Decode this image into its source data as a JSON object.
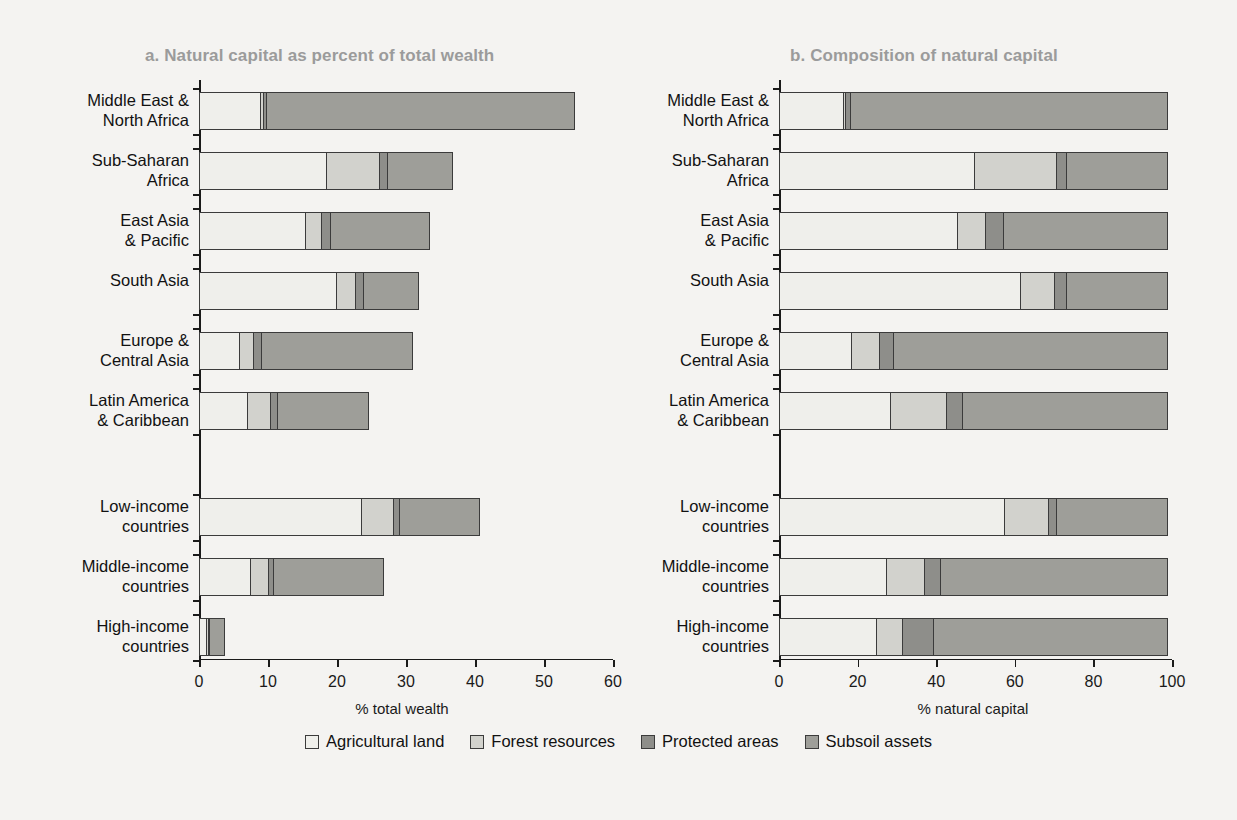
{
  "figure": {
    "panel_a_title": "a. Natural capital as percent of total wealth",
    "panel_b_title": "b. Composition of natural capital"
  },
  "legend": {
    "items": [
      {
        "label": "Agricultural land",
        "color": "#efefeb"
      },
      {
        "label": "Forest resources",
        "color": "#d2d2cd"
      },
      {
        "label": "Protected areas",
        "color": "#8e8e8a"
      },
      {
        "label": "Subsoil assets",
        "color": "#9e9e99"
      }
    ]
  },
  "categories": [
    "Middle East &\nNorth Africa",
    "Sub-Saharan\nAfrica",
    "East Asia\n& Pacific",
    "South Asia",
    "Europe &\nCentral Asia",
    "Latin America\n& Caribbean",
    "Low-income\ncountries",
    "Middle-income\ncountries",
    "High-income\ncountries"
  ],
  "chart_data": [
    {
      "type": "bar",
      "orientation": "horizontal",
      "stacked": true,
      "title": "a. Natural capital as percent of total wealth",
      "xlabel": "% total wealth",
      "ylabel": "",
      "xlim": [
        0,
        60
      ],
      "xticks": [
        0,
        10,
        20,
        30,
        40,
        50,
        60
      ],
      "grid": false,
      "legend_position": "bottom",
      "categories": [
        "Middle East & North Africa",
        "Sub-Saharan Africa",
        "East Asia & Pacific",
        "South Asia",
        "Europe & Central Asia",
        "Latin America & Caribbean",
        "Low-income countries",
        "Middle-income countries",
        "High-income countries"
      ],
      "series": [
        {
          "name": "Agricultural land",
          "values": [
            9.0,
            18.6,
            15.5,
            20.0,
            5.9,
            7.2,
            23.7,
            7.5,
            1.2
          ]
        },
        {
          "name": "Forest resources",
          "values": [
            0.6,
            7.9,
            2.5,
            3.0,
            2.3,
            3.4,
            4.7,
            2.8,
            0.4
          ]
        },
        {
          "name": "Protected areas",
          "values": [
            0.7,
            1.3,
            1.5,
            1.3,
            1.3,
            1.2,
            1.1,
            0.9,
            0.4
          ]
        },
        {
          "name": "Subsoil assets",
          "values": [
            44.7,
            9.5,
            14.5,
            8.1,
            22.0,
            13.4,
            11.7,
            16.1,
            2.3
          ]
        }
      ],
      "totals": [
        55.0,
        37.3,
        34.0,
        32.4,
        31.5,
        25.2,
        41.2,
        27.3,
        4.3
      ]
    },
    {
      "type": "bar",
      "orientation": "horizontal",
      "stacked": true,
      "title": "b. Composition of natural capital",
      "xlabel": "% natural capital",
      "ylabel": "",
      "xlim": [
        0,
        100
      ],
      "xticks": [
        0,
        20,
        40,
        60,
        80,
        100
      ],
      "grid": false,
      "legend_position": "bottom",
      "categories": [
        "Middle East & North Africa",
        "Sub-Saharan Africa",
        "East Asia & Pacific",
        "South Asia",
        "Europe & Central Asia",
        "Latin America & Caribbean",
        "Low-income countries",
        "Middle-income countries",
        "High-income countries"
      ],
      "series": [
        {
          "name": "Agricultural land",
          "values": [
            16.5,
            50.0,
            45.5,
            61.5,
            18.5,
            28.5,
            57.5,
            27.5,
            25.0
          ]
        },
        {
          "name": "Forest resources",
          "values": [
            1.0,
            21.0,
            7.5,
            9.0,
            7.5,
            14.5,
            11.5,
            10.0,
            7.0
          ]
        },
        {
          "name": "Protected areas",
          "values": [
            1.5,
            3.0,
            5.0,
            3.5,
            4.0,
            4.5,
            2.5,
            4.5,
            8.0
          ]
        },
        {
          "name": "Subsoil assets",
          "values": [
            81.0,
            26.0,
            42.0,
            26.0,
            70.0,
            52.5,
            28.5,
            58.0,
            60.0
          ]
        }
      ],
      "totals": [
        100,
        100,
        100,
        100,
        100,
        100,
        100,
        100,
        100
      ]
    }
  ]
}
